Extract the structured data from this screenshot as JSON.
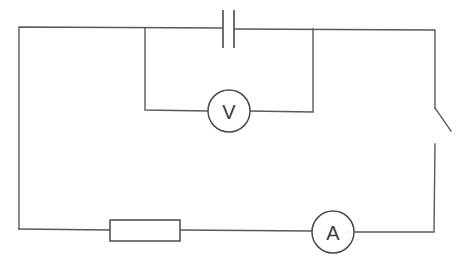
{
  "diagram": {
    "type": "circuit",
    "components": [
      {
        "id": "capacitor",
        "kind": "capacitor",
        "label": ""
      },
      {
        "id": "voltmeter",
        "kind": "voltmeter",
        "label": "V",
        "connection": "parallel with capacitor"
      },
      {
        "id": "switch",
        "kind": "switch",
        "state": "open",
        "label": ""
      },
      {
        "id": "ammeter",
        "kind": "ammeter",
        "label": "A"
      },
      {
        "id": "resistor",
        "kind": "resistor",
        "label": ""
      }
    ],
    "colors": {
      "line": "#5a5a5a",
      "background": "#ffffff"
    }
  },
  "voltmeter": {
    "label": "V"
  },
  "ammeter": {
    "label": "A"
  }
}
